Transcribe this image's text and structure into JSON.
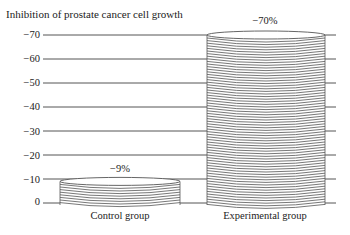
{
  "chart_data": {
    "type": "bar",
    "title": "Inhibition of prostate cancer cell growth",
    "xlabel": "",
    "ylabel": "",
    "categories": [
      "Control group",
      "Experimental group"
    ],
    "values": [
      -9,
      -70
    ],
    "value_labels": [
      "-9%",
      "-70%"
    ],
    "yticks": [
      0,
      -10,
      -20,
      -30,
      -40,
      -50,
      -60,
      -70
    ],
    "ytick_labels": [
      "0",
      "−10",
      "−20",
      "−30",
      "−40",
      "−50",
      "−60",
      "−70"
    ],
    "ylim": [
      0,
      -70
    ],
    "grid": true,
    "legend": null,
    "style": "stacked-disc cylinders"
  },
  "labels": {
    "title": "Inhibition of prostate cancer cell growth",
    "control": "Control group",
    "experimental": "Experimental group",
    "control_value": "−9%",
    "experimental_value": "−70%",
    "y0": "0",
    "y10": "−10",
    "y20": "−20",
    "y30": "−30",
    "y40": "−40",
    "y50": "−50",
    "y60": "−60",
    "y70": "−70"
  },
  "colors": {
    "line": "#555555",
    "text": "#222222",
    "background": "#ffffff"
  }
}
